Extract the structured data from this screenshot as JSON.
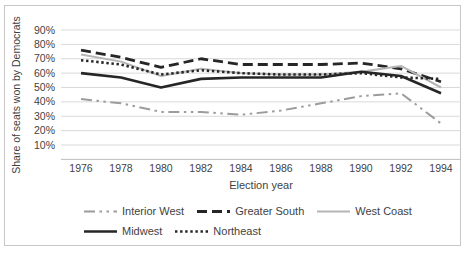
{
  "chart_data": {
    "type": "line",
    "title": "",
    "xlabel": "Election year",
    "ylabel": "Share of seats won by Democrats",
    "categories": [
      "1976",
      "1978",
      "1980",
      "1982",
      "1984",
      "1986",
      "1988",
      "1990",
      "1992",
      "1994"
    ],
    "y_ticks": [
      "90%",
      "80%",
      "70%",
      "60%",
      "50%",
      "40%",
      "30%",
      "20%",
      "10%"
    ],
    "ylim": [
      0,
      93
    ],
    "grid": "horizontal",
    "gridline_color": "#d9d9d9",
    "axis_line_color": "#bfbfbf",
    "text_color": "#3f3f3f",
    "legend_position": "bottom",
    "series": [
      {
        "name": "Interior West",
        "color": "#9c9c9c",
        "dash": "long-dash-dot-dot",
        "width": 2,
        "values": [
          42,
          39,
          33,
          33,
          31,
          34,
          39,
          44,
          46,
          25
        ]
      },
      {
        "name": "Greater South",
        "color": "#262626",
        "dash": "dash",
        "width": 2.8,
        "values": [
          76,
          71,
          64,
          70,
          66,
          66,
          66,
          67,
          63,
          54
        ]
      },
      {
        "name": "West Coast",
        "color": "#b5b5b5",
        "dash": "solid",
        "width": 2,
        "values": [
          73,
          68,
          58,
          63,
          60,
          59,
          59,
          61,
          65,
          50
        ]
      },
      {
        "name": "Midwest",
        "color": "#262626",
        "dash": "solid",
        "width": 2.6,
        "values": [
          60,
          57,
          50,
          56,
          57,
          57,
          57,
          61,
          58,
          46
        ]
      },
      {
        "name": "Northeast",
        "color": "#262626",
        "dash": "dot",
        "width": 2.6,
        "values": [
          69,
          66,
          59,
          62,
          60,
          59,
          59,
          60,
          57,
          56
        ]
      }
    ]
  }
}
